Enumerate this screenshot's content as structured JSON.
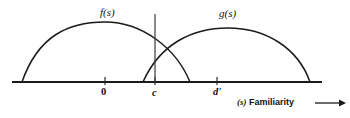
{
  "figure": {
    "title": "",
    "curve_labels": {
      "f": "f(s)",
      "g": "g(s)"
    },
    "tick_labels": {
      "zero": "0",
      "c": "c",
      "dprime": "d'"
    },
    "axis_caption": {
      "variable": "(s)",
      "text": "Familiarity",
      "arrow": "⟶"
    },
    "colors": {
      "ink": "#1a1a1a",
      "background": "#ffffff",
      "criterion": "#3a3a3a"
    }
  },
  "chart_data": {
    "type": "line",
    "title": "",
    "xlabel": "(s) Familiarity",
    "ylabel": "",
    "grid": false,
    "legend": "inline-curve-labels",
    "xlim": [
      12,
      322
    ],
    "ylim": [
      82,
      14
    ],
    "axis": {
      "baseline_y": 82,
      "x_start": 12,
      "x_end": 322
    },
    "ticks": [
      {
        "label": "0",
        "x": 105
      },
      {
        "label": "c",
        "x": 155
      },
      {
        "label": "d'",
        "x": 217
      }
    ],
    "annotations": [
      {
        "name": "criterion-line",
        "label": "c",
        "x": 155,
        "y_top": 14,
        "y_bottom": 82
      }
    ],
    "series": [
      {
        "name": "f(s)",
        "description": "Noise distribution (lure / old-item familiarity density)",
        "peak_x": 105,
        "peak_y": 22,
        "start_x": 22,
        "end_x": 190,
        "path": "M 22,82 C 38,36 68,22 105,22 C 142,22 176,48 190,82"
      },
      {
        "name": "g(s)",
        "description": "Signal distribution (target familiarity density)",
        "peak_x": 228,
        "peak_y": 28,
        "start_x": 143,
        "end_x": 310,
        "path": "M 143,82 C 160,44 192,28 228,28 C 266,28 298,48 310,82"
      }
    ],
    "labels": [
      {
        "text": "f(s)",
        "x": 107,
        "y": 13
      },
      {
        "text": "g(s)",
        "x": 227,
        "y": 14
      }
    ]
  }
}
